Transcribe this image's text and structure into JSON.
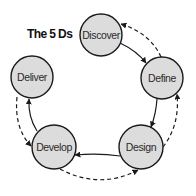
{
  "title": "The 5 Ds",
  "colors": {
    "node_fill": "#dcdcdc",
    "node_stroke": "#1a1a1a",
    "arrow": "#1a1a1a",
    "background": "#ffffff"
  },
  "nodes": [
    {
      "id": "discover",
      "label": "Discover",
      "cx": 101,
      "cy": 35,
      "r": 21
    },
    {
      "id": "define",
      "label": "Define",
      "cx": 162,
      "cy": 78,
      "r": 21
    },
    {
      "id": "design",
      "label": "Design",
      "cx": 141,
      "cy": 147,
      "r": 22
    },
    {
      "id": "develop",
      "label": "Develop",
      "cx": 54,
      "cy": 147,
      "r": 22
    },
    {
      "id": "deliver",
      "label": "Deliver",
      "cx": 32,
      "cy": 77,
      "r": 21
    }
  ],
  "edges": [
    {
      "from": "Discover",
      "to": "Define",
      "style": "solid"
    },
    {
      "from": "Define",
      "to": "Discover",
      "style": "dashed"
    },
    {
      "from": "Define",
      "to": "Design",
      "style": "solid"
    },
    {
      "from": "Design",
      "to": "Define",
      "style": "dashed"
    },
    {
      "from": "Design",
      "to": "Develop",
      "style": "solid"
    },
    {
      "from": "Develop",
      "to": "Design",
      "style": "dashed"
    },
    {
      "from": "Develop",
      "to": "Deliver",
      "style": "solid"
    },
    {
      "from": "Deliver",
      "to": "Develop",
      "style": "dashed"
    }
  ]
}
